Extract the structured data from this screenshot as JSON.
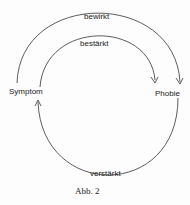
{
  "diagram": {
    "nodes": {
      "symptom": "Symptom",
      "phobie": "Phobie"
    },
    "edges": {
      "outer": "bewirkt",
      "inner": "bestärkt",
      "bottom": "verstärkt"
    },
    "caption": "Abb. 2",
    "stroke_color": "#333333"
  }
}
